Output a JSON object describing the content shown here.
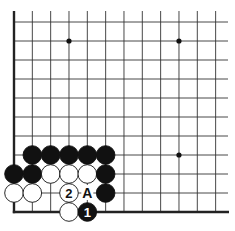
{
  "diagram": {
    "type": "go-board-fragment",
    "corner": "bottom-left",
    "columns_visible": 12,
    "rows_visible": 11,
    "colors": {
      "black_stone": "#111111",
      "white_stone": "#ffffff",
      "line": "#333333",
      "edge": "#222222"
    },
    "star_points": [
      {
        "col": 3,
        "row": 9
      },
      {
        "col": 9,
        "row": 9
      },
      {
        "col": 9,
        "row": 3
      }
    ],
    "stones": [
      {
        "color": "black",
        "col": 1,
        "row": 3,
        "label": ""
      },
      {
        "color": "black",
        "col": 2,
        "row": 3,
        "label": ""
      },
      {
        "color": "black",
        "col": 3,
        "row": 3,
        "label": ""
      },
      {
        "color": "black",
        "col": 4,
        "row": 3,
        "label": ""
      },
      {
        "color": "black",
        "col": 5,
        "row": 3,
        "label": ""
      },
      {
        "color": "black",
        "col": 0,
        "row": 2,
        "label": ""
      },
      {
        "color": "black",
        "col": 1,
        "row": 2,
        "label": ""
      },
      {
        "color": "white",
        "col": 2,
        "row": 2,
        "label": ""
      },
      {
        "color": "white",
        "col": 3,
        "row": 2,
        "label": ""
      },
      {
        "color": "white",
        "col": 4,
        "row": 2,
        "label": ""
      },
      {
        "color": "black",
        "col": 5,
        "row": 2,
        "label": ""
      },
      {
        "color": "white",
        "col": 0,
        "row": 1,
        "label": ""
      },
      {
        "color": "white",
        "col": 1,
        "row": 1,
        "label": ""
      },
      {
        "color": "white",
        "col": 3,
        "row": 1,
        "label": "2"
      },
      {
        "color": "black",
        "col": 5,
        "row": 1,
        "label": ""
      },
      {
        "color": "white",
        "col": 3,
        "row": 0,
        "label": ""
      },
      {
        "color": "black",
        "col": 4,
        "row": 0,
        "label": "1"
      }
    ],
    "markers": [
      {
        "col": 4,
        "row": 1,
        "label": "A"
      }
    ]
  }
}
